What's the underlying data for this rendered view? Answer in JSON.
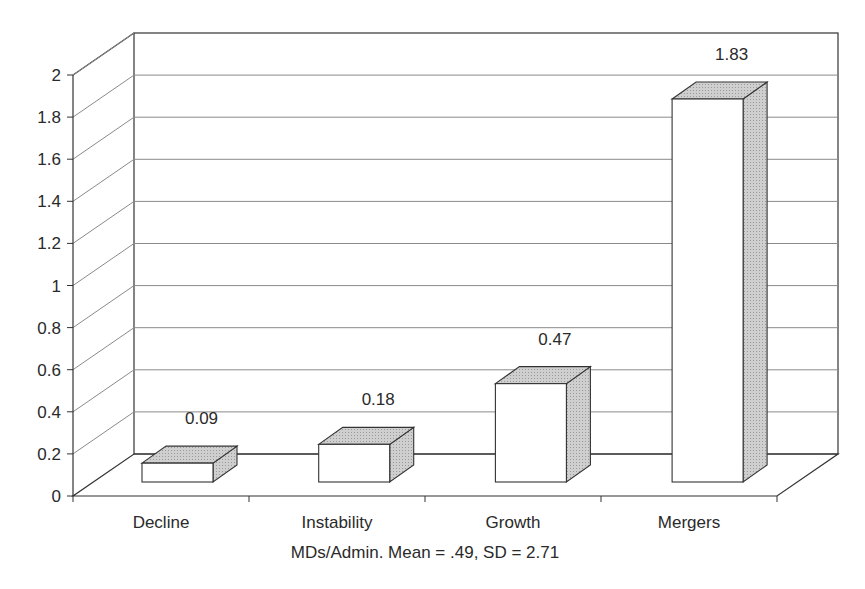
{
  "chart_data": {
    "type": "bar",
    "style": "3d-column",
    "title": "",
    "xlabel": "MDs/Admin. Mean = .49, SD = 2.71",
    "ylabel": "",
    "categories": [
      "Decline",
      "Instability",
      "Growth",
      "Mergers"
    ],
    "values": [
      0.09,
      0.18,
      0.47,
      1.83
    ],
    "data_labels": [
      "0.09",
      "0.18",
      "0.47",
      "1.83"
    ],
    "ylim": [
      0,
      2
    ],
    "yticks": [
      0,
      0.2,
      0.4,
      0.6,
      0.8,
      1,
      1.2,
      1.4,
      1.6,
      1.8,
      2
    ],
    "ytick_labels": [
      "0",
      "0.2",
      "0.4",
      "0.6",
      "0.8",
      "1",
      "1.2",
      "1.4",
      "1.6",
      "1.8",
      "2"
    ],
    "grid": true,
    "legend": null,
    "colors": {
      "bar_front": "#ffffff",
      "bar_top": "#c8c8c8",
      "bar_side": "#b8b8b8",
      "outline": "#333333",
      "grid": "#8a8a8a"
    }
  }
}
